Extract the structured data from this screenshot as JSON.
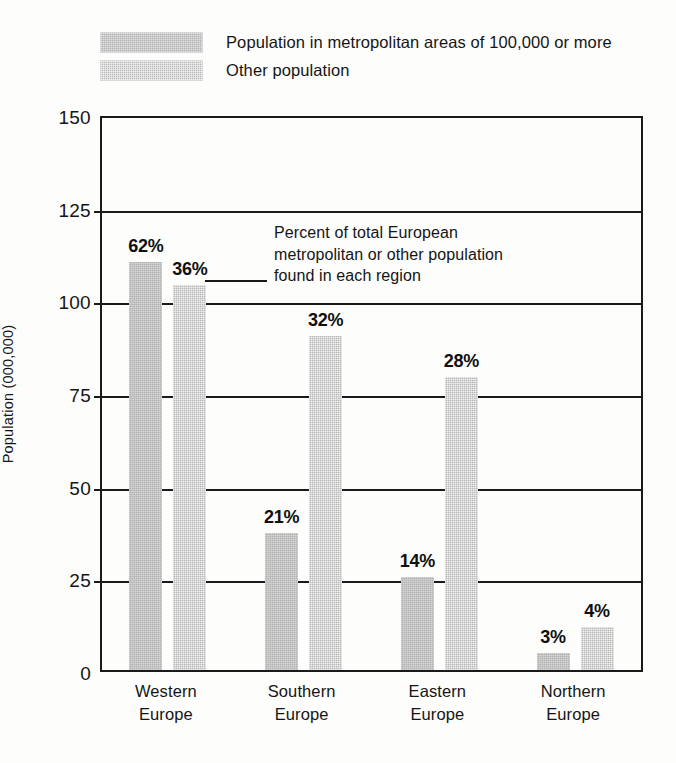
{
  "legend": {
    "items": [
      {
        "label": "Population in metropolitan areas of 100,000 or more",
        "swatch": "metro-swatch",
        "color": "#b4b4b4"
      },
      {
        "label": "Other population",
        "swatch": "other-swatch",
        "color": "#b8b8b8"
      }
    ],
    "position": "top-left"
  },
  "annotation": {
    "line1": "Percent of total European",
    "line2": "metropolitan or other population",
    "line3": "found in each region",
    "leader_from": "36% bar"
  },
  "chart_data": {
    "type": "bar",
    "title": "",
    "subtitle": "",
    "xlabel": "",
    "ylabel": "Population (000,000)",
    "ylim": [
      0,
      150
    ],
    "yticks": [
      0,
      25,
      50,
      75,
      100,
      125,
      150
    ],
    "ytick_labels": [
      "0",
      "25",
      "50",
      "75",
      "100",
      "125",
      "150"
    ],
    "grid": true,
    "grid_axis": "y",
    "legend_position": "above-plot-left",
    "categories": [
      "Western\nEurope",
      "Southern\nEurope",
      "Eastern\nEurope",
      "Northern\nEurope"
    ],
    "category_lines": [
      [
        "Western",
        "Europe"
      ],
      [
        "Southern",
        "Europe"
      ],
      [
        "Eastern",
        "Europe"
      ],
      [
        "Northern",
        "Europe"
      ]
    ],
    "series": [
      {
        "name": "Population in metropolitan areas of 100,000 or more",
        "key": "metro",
        "color": "#b2b2b2",
        "values": [
          110,
          37,
          25,
          4.5
        ],
        "labels": [
          "62%",
          "21%",
          "14%",
          "3%"
        ]
      },
      {
        "name": "Other population",
        "key": "other",
        "color": "#b6b6b6",
        "values": [
          104,
          90,
          79,
          11.5
        ],
        "labels": [
          "36%",
          "32%",
          "28%",
          "4%"
        ]
      }
    ]
  },
  "colors": {
    "axis": "#1a1a1a",
    "text": "#151515",
    "background": "#fdfdfc",
    "metro_fill": "#b2b2b2",
    "other_fill": "#b6b6b6"
  }
}
